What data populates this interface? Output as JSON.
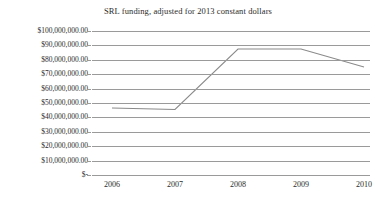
{
  "chart_data": {
    "type": "line",
    "title": "SRL funding, adjusted for 2013 constant dollars",
    "xlabel": "",
    "ylabel": "",
    "x": [
      2006,
      2007,
      2008,
      2009,
      2010
    ],
    "categories": [
      "2006",
      "2007",
      "2008",
      "2009",
      "2010"
    ],
    "series": [
      {
        "name": "SRL funding",
        "values": [
          46500000,
          45500000,
          87500000,
          87500000,
          75000000
        ],
        "color": "#8a8a8a"
      }
    ],
    "ylim": [
      0,
      100000000
    ],
    "ytick_values": [
      0,
      10000000,
      20000000,
      30000000,
      40000000,
      50000000,
      60000000,
      70000000,
      80000000,
      90000000,
      100000000
    ],
    "ytick_labels": [
      "$-",
      "$10,000,000.00",
      "$20,000,000.00",
      "$30,000,000.00",
      "$40,000,000.00",
      "$50,000,000.00",
      "$60,000,000.00",
      "$70,000,000.00",
      "$80,000,000.00",
      "$90,000,000.00",
      "$100,000,000.00"
    ],
    "xtick_labels": [
      "2006",
      "2007",
      "2008",
      "2009",
      "2010"
    ],
    "grid": "horizontal",
    "gridline_color": "#9a9a9a",
    "legend": "none",
    "background": "#ffffff",
    "text_color": "#2b2b2b"
  }
}
